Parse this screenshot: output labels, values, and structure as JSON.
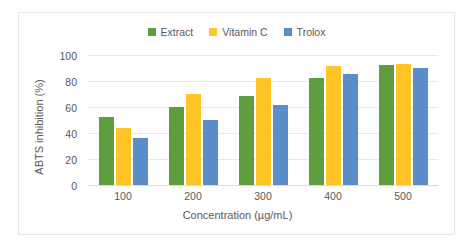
{
  "chart_data": {
    "type": "bar",
    "title": "",
    "xlabel": "Concentration (µg/mL)",
    "ylabel": "ABTS inhibition (%)",
    "categories": [
      "100",
      "200",
      "300",
      "400",
      "500"
    ],
    "series": [
      {
        "name": "Extract",
        "color": "#5E9E3F",
        "values": [
          53,
          61,
          69,
          83,
          93
        ]
      },
      {
        "name": "Vitamin C",
        "color": "#FFC425",
        "values": [
          45,
          71,
          83,
          92,
          94
        ]
      },
      {
        "name": "Trolox",
        "color": "#5B8DC8",
        "values": [
          37,
          51,
          62,
          86,
          91
        ]
      }
    ],
    "ylim": [
      0,
      100
    ],
    "yticks": [
      "0",
      "20",
      "40",
      "60",
      "80",
      "100"
    ],
    "grid": true,
    "legend_position": "top-center"
  },
  "legend": {
    "items": [
      {
        "label": "Extract"
      },
      {
        "label": "Vitamin C"
      },
      {
        "label": "Trolox"
      }
    ]
  }
}
